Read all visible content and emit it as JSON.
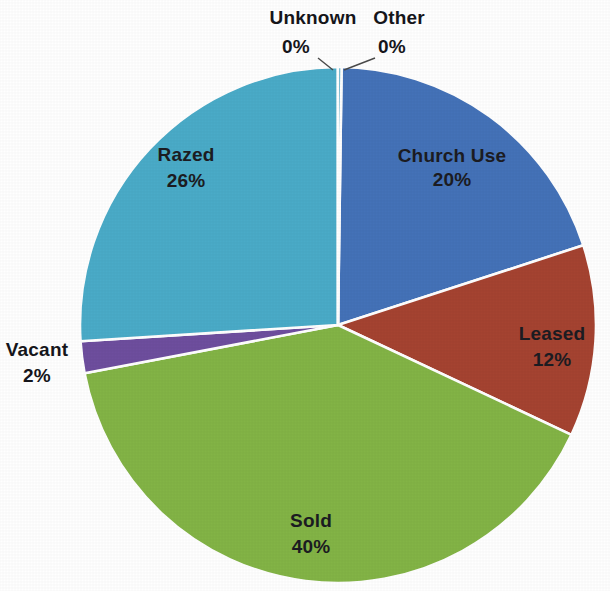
{
  "chart_data": {
    "type": "pie",
    "title": "",
    "subtitle": "",
    "legend_position": "none",
    "labels_inside": true,
    "background_color": "#ffffff",
    "slice_border_color": "#ffffff",
    "geometry": {
      "center_x": 338,
      "center_y": 325,
      "radius": 258,
      "start_angle_deg": 0,
      "direction": "clockwise"
    },
    "categories": [
      "Church Use",
      "Leased",
      "Sold",
      "Vacant",
      "Razed",
      "Unknown",
      "Other"
    ],
    "values": [
      20,
      12,
      40,
      2,
      26,
      0,
      0
    ],
    "value_suffix": "%",
    "colors": [
      "#4472b8",
      "#a54331",
      "#83b446",
      "#6e4e9e",
      "#4aabc8",
      "#3f6fb5",
      "#46a3c4"
    ],
    "slices": [
      {
        "label": "Church Use",
        "value": 20,
        "value_text": "20%",
        "color": "#4472b8",
        "label_placement": "inside",
        "label_x": 452,
        "label_y": 162,
        "value_x": 452,
        "value_y": 186
      },
      {
        "label": "Leased",
        "value": 12,
        "value_text": "12%",
        "color": "#a54331",
        "label_placement": "inside",
        "label_x": 552,
        "label_y": 340,
        "value_x": 552,
        "value_y": 366
      },
      {
        "label": "Sold",
        "value": 40,
        "value_text": "40%",
        "color": "#83b446",
        "label_placement": "inside",
        "label_x": 311,
        "label_y": 527,
        "value_x": 311,
        "value_y": 553
      },
      {
        "label": "Vacant",
        "value": 2,
        "value_text": "2%",
        "color": "#6e4e9e",
        "label_placement": "outside-left",
        "label_x": 37,
        "label_y": 356,
        "value_x": 37,
        "value_y": 382
      },
      {
        "label": "Razed",
        "value": 26,
        "value_text": "26%",
        "color": "#4aabc8",
        "label_placement": "inside",
        "label_x": 186,
        "label_y": 161,
        "value_x": 186,
        "value_y": 187
      },
      {
        "label": "Unknown",
        "value": 0,
        "value_text": "0%",
        "color": "#3f6fb5",
        "label_placement": "outside-top",
        "label_x": 313,
        "label_y": 24,
        "value_x": 296,
        "value_y": 53
      },
      {
        "label": "Other",
        "value": 0,
        "value_text": "0%",
        "color": "#46a3c4",
        "label_placement": "outside-top",
        "label_x": 399,
        "label_y": 24,
        "value_x": 392,
        "value_y": 53
      }
    ],
    "leader_lines": [
      {
        "name": "unknown-leader",
        "d": "M 318 58 L 333 70"
      },
      {
        "name": "other-leader",
        "d": "M 375 58 L 344 70"
      }
    ]
  }
}
